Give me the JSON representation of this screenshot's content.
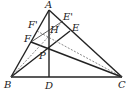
{
  "diagram": {
    "type": "geometry",
    "points": {
      "A": {
        "label": "A",
        "x": 49,
        "y": 10
      },
      "B": {
        "label": "B",
        "x": 11,
        "y": 77
      },
      "C": {
        "label": "C",
        "x": 122,
        "y": 77
      },
      "D": {
        "label": "D",
        "x": 49,
        "y": 77
      },
      "P": {
        "label": "P",
        "x": 49,
        "y": 51
      },
      "E": {
        "label": "E",
        "x": 70,
        "y": 31
      },
      "F": {
        "label": "F",
        "x": 31,
        "y": 42
      },
      "E_prime": {
        "label": "E'",
        "x": 63,
        "y": 21
      },
      "F_prime": {
        "label": "F'",
        "x": 37,
        "y": 31
      },
      "H": {
        "label": "H",
        "x": 49,
        "y": 37
      }
    },
    "segments": {
      "solid": [
        "AB",
        "AC",
        "BC",
        "AD",
        "BE",
        "CF",
        "FE'"
      ],
      "dashed": [
        "BE'",
        "F'C"
      ]
    }
  }
}
